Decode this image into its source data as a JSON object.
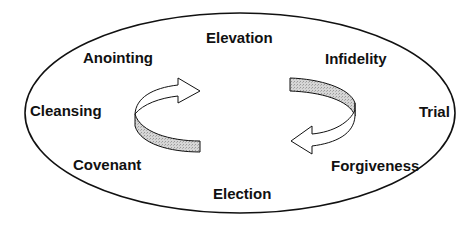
{
  "diagram": {
    "type": "cycle",
    "labels": {
      "elevation": "Elevation",
      "infidelity": "Infidelity",
      "trial": "Trial",
      "forgiveness": "Forgiveness",
      "election": "Election",
      "covenant": "Covenant",
      "cleansing": "Cleansing",
      "anointing": "Anointing"
    },
    "sequence": [
      "Elevation",
      "Infidelity",
      "Trial",
      "Forgiveness",
      "Election",
      "Covenant",
      "Cleansing",
      "Anointing"
    ],
    "arrows": [
      {
        "position": "left",
        "direction": "clockwise-up-right"
      },
      {
        "position": "right",
        "direction": "clockwise-down-left"
      }
    ],
    "colors": {
      "stroke": "#111111",
      "arrow_shade": "#cfcfcf",
      "background": "#ffffff"
    }
  }
}
